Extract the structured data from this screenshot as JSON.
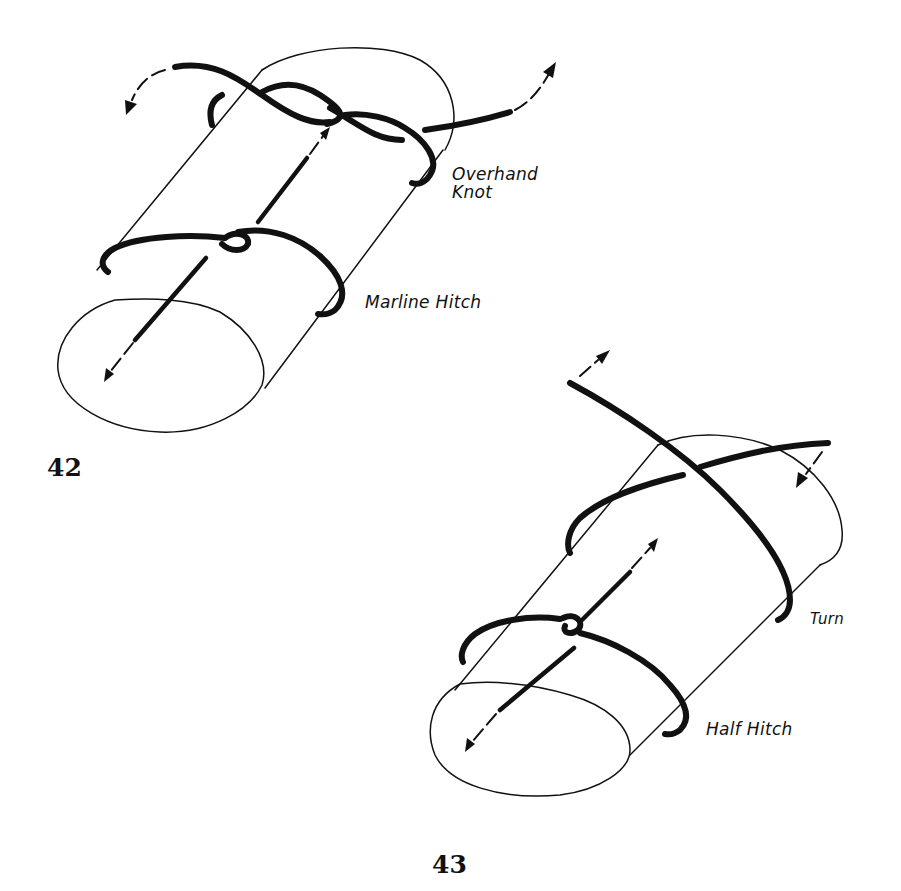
{
  "figures": [
    {
      "number": "42",
      "title": "Marline hitch with overhand knot",
      "labels": {
        "top": [
          "Overhand",
          "Knot"
        ],
        "bottom": "Marline Hitch"
      }
    },
    {
      "number": "43",
      "title": "Turn with half hitch",
      "labels": {
        "top": "Turn",
        "bottom": "Half Hitch"
      }
    }
  ],
  "colors": {
    "ink": "#111111",
    "paper": "#ffffff"
  }
}
